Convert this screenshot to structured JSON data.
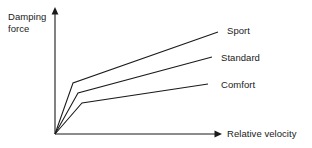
{
  "figure": {
    "background_color": "#ffffff",
    "line_color": "#1a1a1a",
    "width": 312,
    "height": 148
  },
  "axes": {
    "y_label_line1": "Damping",
    "y_label_line2": "force",
    "x_label": "Relative velocity"
  },
  "series_labels": {
    "sport": "Sport",
    "standard": "Standard",
    "comfort": "Comfort"
  },
  "chart_data": {
    "type": "line",
    "title": "",
    "subtitle": "",
    "xlabel": "Relative velocity",
    "ylabel": "Damping force",
    "grid": false,
    "legend_position": "inline-right-end-of-line",
    "annotations": [
      "Sport",
      "Standard",
      "Comfort"
    ],
    "axis_style": "arrow-ended qualitative axes, no tick marks, no numeric scale",
    "xlim": [
      0,
      1
    ],
    "ylim": [
      0,
      1
    ],
    "note": "Qualitative bilinear damper characteristic curves; values are normalized 0-1 read off the unlabelled axes.",
    "series": [
      {
        "name": "Sport",
        "x": [
          0,
          0.108,
          0.976
        ],
        "y": [
          0,
          0.405,
          0.81
        ]
      },
      {
        "name": "Standard",
        "x": [
          0,
          0.138,
          0.94
        ],
        "y": [
          0,
          0.325,
          0.611
        ]
      },
      {
        "name": "Comfort",
        "x": [
          0,
          0.162,
          0.917
        ],
        "y": [
          0,
          0.246,
          0.397
        ]
      }
    ],
    "pixel_geometry": {
      "origin": [
        55,
        134
      ],
      "y_axis_tip": [
        55,
        8
      ],
      "x_axis_tip": [
        222,
        134
      ],
      "sport_points": [
        [
          55,
          134
        ],
        [
          73,
          83
        ],
        [
          218,
          32
        ]
      ],
      "standard_points": [
        [
          55,
          134
        ],
        [
          78,
          93
        ],
        [
          212,
          57
        ]
      ],
      "comfort_points": [
        [
          55,
          134
        ],
        [
          82,
          103
        ],
        [
          208,
          84
        ]
      ]
    }
  }
}
